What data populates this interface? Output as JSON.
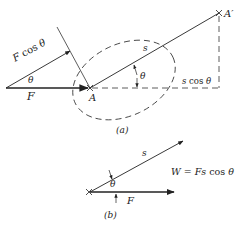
{
  "figure_a": {
    "caption": "(a)",
    "labels": {
      "force_component": "F cos θ",
      "theta_left": "θ",
      "force": "F",
      "point_start": "A",
      "point_end": "A′",
      "displacement": "s",
      "theta_right": "θ",
      "displacement_component": "s cos θ"
    }
  },
  "figure_b": {
    "caption": "(b)",
    "labels": {
      "displacement": "s",
      "theta": "θ",
      "force": "F",
      "work_formula": "W = Fs cos θ"
    }
  },
  "colors": {
    "ink": "#222222",
    "background": "#ffffff"
  }
}
